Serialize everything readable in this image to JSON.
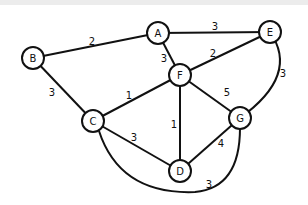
{
  "graph": {
    "nodes": [
      {
        "id": "A",
        "x": 158,
        "y": 33
      },
      {
        "id": "E",
        "x": 270,
        "y": 32
      },
      {
        "id": "B",
        "x": 33,
        "y": 58
      },
      {
        "id": "F",
        "x": 180,
        "y": 75
      },
      {
        "id": "C",
        "x": 93,
        "y": 121
      },
      {
        "id": "G",
        "x": 240,
        "y": 118
      },
      {
        "id": "D",
        "x": 180,
        "y": 171
      }
    ],
    "edges": [
      {
        "from": "B",
        "to": "A",
        "weight": "2",
        "lx": 92,
        "ly": 41
      },
      {
        "from": "A",
        "to": "E",
        "weight": "3",
        "lx": 215,
        "ly": 26
      },
      {
        "from": "A",
        "to": "F",
        "weight": "3",
        "lx": 164,
        "ly": 58
      },
      {
        "from": "F",
        "to": "E",
        "weight": "2",
        "lx": 213,
        "ly": 53
      },
      {
        "from": "E",
        "to": "G",
        "weight": "3",
        "lx": 283,
        "ly": 73
      },
      {
        "from": "B",
        "to": "C",
        "weight": "3",
        "lx": 52,
        "ly": 92
      },
      {
        "from": "C",
        "to": "F",
        "weight": "1",
        "lx": 129,
        "ly": 95
      },
      {
        "from": "F",
        "to": "G",
        "weight": "5",
        "lx": 227,
        "ly": 92
      },
      {
        "from": "F",
        "to": "D",
        "weight": "1",
        "lx": 174,
        "ly": 124
      },
      {
        "from": "C",
        "to": "D",
        "weight": "3",
        "lx": 134,
        "ly": 137
      },
      {
        "from": "D",
        "to": "G",
        "weight": "4",
        "lx": 221,
        "ly": 143
      },
      {
        "from": "C",
        "to": "G",
        "weight": "3",
        "lx": 209,
        "ly": 184
      }
    ]
  }
}
